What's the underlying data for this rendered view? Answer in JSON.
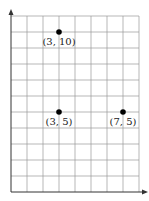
{
  "chart_data": {
    "type": "scatter",
    "title": "",
    "xlabel": "",
    "ylabel": "",
    "xlim": [
      0,
      8
    ],
    "ylim": [
      0,
      11
    ],
    "grid": true,
    "legend": null,
    "points": [
      {
        "x": 3,
        "y": 10,
        "label": "(3, 10)"
      },
      {
        "x": 3,
        "y": 5,
        "label": "(3, 5)"
      },
      {
        "x": 7,
        "y": 5,
        "label": "(7, 5)"
      }
    ]
  },
  "colors": {
    "grid": "#9a9a9a",
    "axis": "#333333",
    "point": "#000000"
  }
}
